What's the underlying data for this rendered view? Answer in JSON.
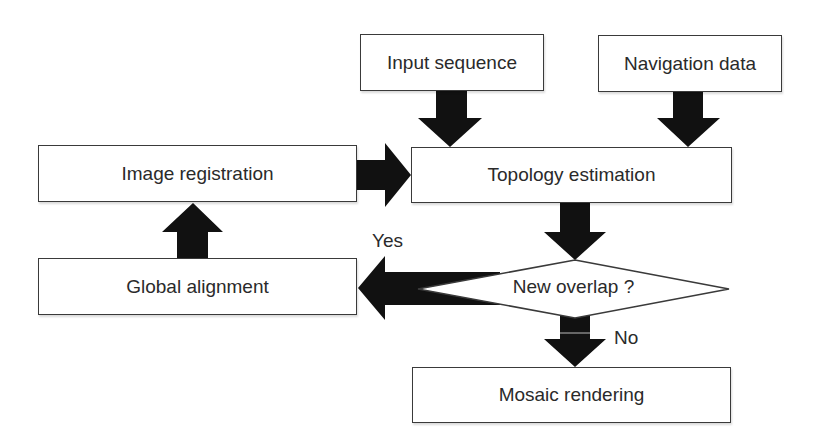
{
  "diagram": {
    "type": "flowchart",
    "nodes": {
      "input_sequence": "Input sequence",
      "navigation_data": "Navigation data",
      "image_registration": "Image registration",
      "topology_estimation": "Topology estimation",
      "global_alignment": "Global alignment",
      "new_overlap": "New overlap ?",
      "mosaic_rendering": "Mosaic rendering"
    },
    "edge_labels": {
      "yes": "Yes",
      "no": "No"
    },
    "edges": [
      {
        "from": "Input sequence",
        "to": "Topology estimation"
      },
      {
        "from": "Navigation data",
        "to": "Topology estimation"
      },
      {
        "from": "Image registration",
        "to": "Topology estimation"
      },
      {
        "from": "Topology estimation",
        "to": "New overlap ?"
      },
      {
        "from": "New overlap ?",
        "to": "Global alignment",
        "label": "Yes"
      },
      {
        "from": "Global alignment",
        "to": "Image registration"
      },
      {
        "from": "New overlap ?",
        "to": "Mosaic rendering",
        "label": "No"
      }
    ],
    "colors": {
      "arrow": "#111111",
      "border": "#3a3a3a",
      "text": "#2a2a2a"
    }
  }
}
